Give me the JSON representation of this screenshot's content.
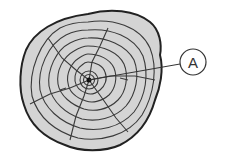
{
  "diagram": {
    "labels": [
      {
        "id": "A",
        "text": "A",
        "points_to": "center (pith)"
      }
    ],
    "colors": {
      "wood_fill": "#d4d4d4",
      "ring_stroke": "#3a3a3a",
      "bark_stroke": "#222222",
      "background": "#ffffff"
    }
  }
}
